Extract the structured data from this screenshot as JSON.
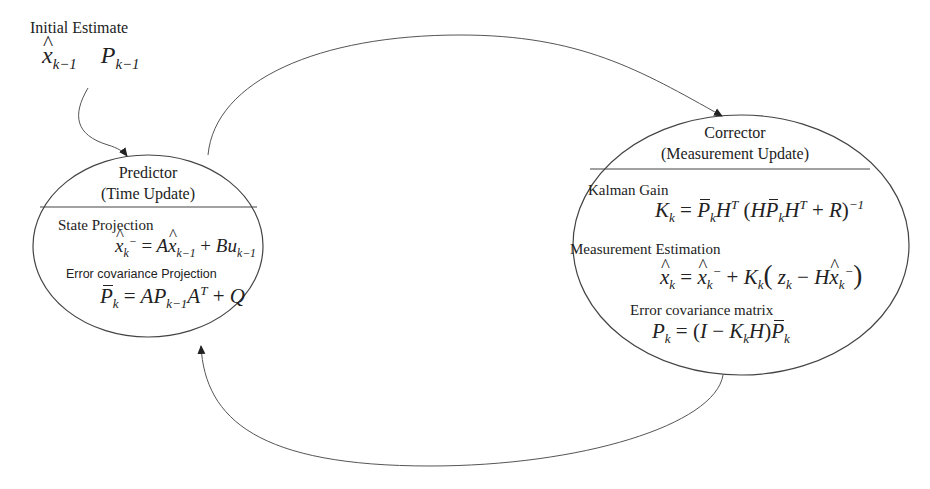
{
  "initial_estimate": {
    "label": "Initial Estimate",
    "x_hat": "x",
    "x_sub": "k−1",
    "p": "P",
    "p_sub": "k−1"
  },
  "predictor": {
    "title": "Predictor",
    "subtitle": "(Time Update)",
    "sections": [
      {
        "label": "State Projection",
        "equation": "x̂⁻_k = A x̂_{k−1} + B u_{k−1}"
      },
      {
        "label": "Error covariance Projection",
        "equation": "P̄_k = A P_{k−1} A^T + Q"
      }
    ]
  },
  "corrector": {
    "title": "Corrector",
    "subtitle": "(Measurement Update)",
    "sections": [
      {
        "label": "Kalman Gain",
        "equation": "K_k = P̄_k H^T (H P̄_k H^T + R)^{−1}"
      },
      {
        "label": "Measurement Estimation",
        "equation": "x̂_k = x̂⁻_k + K_k ( z_k − H x̂⁻_k )"
      },
      {
        "label": "Error covariance matrix",
        "equation": "P_k = (I − K_k H) P̄_k"
      }
    ]
  },
  "edges": [
    {
      "from": "initial_estimate",
      "to": "predictor"
    },
    {
      "from": "predictor",
      "to": "corrector"
    },
    {
      "from": "corrector",
      "to": "predictor"
    }
  ],
  "colors": {
    "stroke": "#444444",
    "text": "#222222",
    "background": "#ffffff"
  }
}
